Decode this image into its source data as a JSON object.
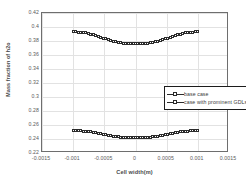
{
  "chart_data": {
    "type": "line",
    "title": "",
    "xlabel": "Cell width(m)",
    "ylabel": "Mass fraction of h2o",
    "xlim": [
      -0.0015,
      0.0015
    ],
    "ylim": [
      0.22,
      0.42
    ],
    "grid": true,
    "legend_position": "center",
    "xticks": [
      -0.0015,
      -0.001,
      -0.0005,
      0,
      0.0005,
      0.001,
      0.0015
    ],
    "xtick_labels": [
      "-0.0015",
      "-0.001",
      "-0.0005",
      "0",
      "0.0005",
      "0.001",
      "0.0015"
    ],
    "yticks": [
      0.22,
      0.24,
      0.26,
      0.28,
      0.3,
      0.32,
      0.34,
      0.36,
      0.38,
      0.4,
      0.42
    ],
    "ytick_labels": [
      "0.22",
      "0.24",
      "0.26",
      "0.28",
      "0.3",
      "0.32",
      "0.34",
      "0.36",
      "0.38",
      "0.4",
      "0.42"
    ],
    "marker": "open-square",
    "x": [
      -0.001,
      -0.00096,
      -0.00092,
      -0.00088,
      -0.00084,
      -0.0008,
      -0.00076,
      -0.00072,
      -0.00068,
      -0.00064,
      -0.0006,
      -0.00056,
      -0.00052,
      -0.00048,
      -0.00044,
      -0.0004,
      -0.00036,
      -0.00032,
      -0.00028,
      -0.00024,
      -0.0002,
      -0.00016,
      -0.00012,
      -8e-05,
      -4e-05,
      0.0,
      4e-05,
      8e-05,
      0.00012,
      0.00016,
      0.0002,
      0.00024,
      0.00028,
      0.00032,
      0.00036,
      0.0004,
      0.00044,
      0.00048,
      0.00052,
      0.00056,
      0.0006,
      0.00064,
      0.00068,
      0.00072,
      0.00076,
      0.0008,
      0.00084,
      0.00088,
      0.00092,
      0.00096,
      0.001
    ],
    "series": [
      {
        "name": "base case",
        "values": [
          0.393,
          0.3929,
          0.3927,
          0.3924,
          0.392,
          0.3915,
          0.3908,
          0.39,
          0.389,
          0.3879,
          0.3867,
          0.3854,
          0.3841,
          0.3829,
          0.3817,
          0.3806,
          0.3796,
          0.3788,
          0.3781,
          0.3775,
          0.377,
          0.3766,
          0.3763,
          0.3761,
          0.376,
          0.376,
          0.376,
          0.3761,
          0.3763,
          0.3766,
          0.377,
          0.3775,
          0.3781,
          0.3788,
          0.3796,
          0.3806,
          0.3817,
          0.3829,
          0.3841,
          0.3854,
          0.3867,
          0.3879,
          0.389,
          0.39,
          0.3908,
          0.3915,
          0.392,
          0.3924,
          0.3927,
          0.3929,
          0.393
        ]
      },
      {
        "name": "case with prominent GDLs",
        "values": [
          0.252,
          0.2519,
          0.2518,
          0.2516,
          0.2513,
          0.251,
          0.2506,
          0.2501,
          0.2495,
          0.2488,
          0.2481,
          0.2473,
          0.2466,
          0.2459,
          0.2452,
          0.2446,
          0.244,
          0.2435,
          0.2431,
          0.2427,
          0.2424,
          0.2422,
          0.242,
          0.2419,
          0.2418,
          0.2418,
          0.2418,
          0.2419,
          0.242,
          0.2422,
          0.2424,
          0.2427,
          0.2431,
          0.2435,
          0.244,
          0.2446,
          0.2452,
          0.2459,
          0.2466,
          0.2473,
          0.2481,
          0.2488,
          0.2495,
          0.2501,
          0.2506,
          0.251,
          0.2513,
          0.2516,
          0.2518,
          0.2519,
          0.252
        ]
      }
    ]
  },
  "colors": {
    "series_line": "#2b2b2b",
    "marker_fill": "#ffffff",
    "grid": "#e2e2e2",
    "frame": "#6e6e6e",
    "text": "#4a4a4a",
    "background": "#ffffff"
  }
}
